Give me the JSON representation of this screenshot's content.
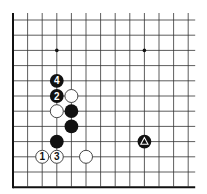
{
  "diagram": {
    "type": "go-board-fragment",
    "grid": {
      "columns": 13,
      "rows": 12,
      "origin_x": 13,
      "origin_y": 20,
      "spacing_x": 14.6,
      "spacing_y": 15.2,
      "open_top": true,
      "open_right": true,
      "edge_left": true,
      "edge_bottom": true,
      "line_color": "#333333",
      "edge_color": "#111111"
    },
    "star_points": [
      {
        "col": 3,
        "row": 2
      },
      {
        "col": 9,
        "row": 2
      }
    ],
    "stones": [
      {
        "color": "black",
        "col": 3,
        "row": 4,
        "label": "4"
      },
      {
        "color": "black",
        "col": 3,
        "row": 5,
        "label": "2"
      },
      {
        "color": "white",
        "col": 4,
        "row": 5,
        "label": ""
      },
      {
        "color": "white",
        "col": 3,
        "row": 6,
        "label": ""
      },
      {
        "color": "black",
        "col": 4,
        "row": 6,
        "label": ""
      },
      {
        "color": "black",
        "col": 4,
        "row": 7,
        "label": ""
      },
      {
        "color": "black",
        "col": 3,
        "row": 8,
        "label": ""
      },
      {
        "color": "white",
        "col": 2,
        "row": 9,
        "label": "1"
      },
      {
        "color": "white",
        "col": 3,
        "row": 9,
        "label": "3"
      },
      {
        "color": "white",
        "col": 5,
        "row": 9,
        "label": ""
      },
      {
        "color": "black",
        "col": 9,
        "row": 8,
        "label": "",
        "marker": "triangle"
      }
    ],
    "colors": {
      "black_stone": "#111111",
      "white_stone": "#ffffff",
      "white_stone_border": "#333333",
      "label_on_black": "#ffffff",
      "label_on_white": "#111111"
    }
  }
}
